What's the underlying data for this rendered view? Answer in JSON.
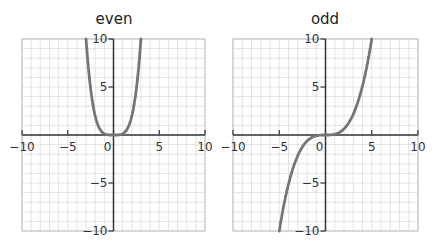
{
  "colors": {
    "curve": "#757575",
    "axis": "#333333",
    "grid": "#dcdcdc",
    "border": "#bdbdbd"
  },
  "chart_data": [
    {
      "type": "line",
      "title": "even",
      "xlabel": "",
      "ylabel": "",
      "xlim": [
        -10,
        10
      ],
      "ylim": [
        -10,
        10
      ],
      "grid": true,
      "x_ticks": [
        -10,
        -5,
        0,
        5,
        10
      ],
      "y_ticks": [
        -10,
        -5,
        5,
        10
      ],
      "series": [
        {
          "name": "even function",
          "x": [
            -3,
            -2.5,
            -2,
            -1.5,
            -1,
            -0.5,
            0,
            0.5,
            1,
            1.5,
            2,
            2.5,
            3
          ],
          "values": [
            10,
            4.8,
            2,
            0.6,
            0.1,
            0,
            0,
            0,
            0.1,
            0.6,
            2,
            4.8,
            10
          ]
        }
      ]
    },
    {
      "type": "line",
      "title": "odd",
      "xlabel": "",
      "ylabel": "",
      "xlim": [
        -10,
        10
      ],
      "ylim": [
        -10,
        10
      ],
      "grid": true,
      "x_ticks": [
        -10,
        -5,
        0,
        5,
        10
      ],
      "y_ticks": [
        -10,
        -5,
        5,
        10
      ],
      "series": [
        {
          "name": "odd function",
          "x": [
            -5,
            -4,
            -3,
            -2,
            -1,
            0,
            1,
            2,
            3,
            4,
            5
          ],
          "values": [
            -10,
            -5.1,
            -2.2,
            -0.6,
            -0.1,
            0,
            0.1,
            0.6,
            2.2,
            5.1,
            10
          ]
        }
      ]
    }
  ],
  "labels": {
    "even_title": "even",
    "odd_title": "odd"
  }
}
